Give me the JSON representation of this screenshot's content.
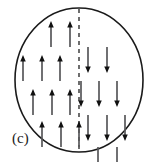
{
  "figure": {
    "panel_label": "(c)",
    "label_position": {
      "x": 12,
      "y": 131
    },
    "width": 156,
    "height": 162,
    "background_color": "#ffffff"
  },
  "boundary": {
    "shape": "circle",
    "center_x": 79,
    "center_y": 80,
    "radius_x": 64,
    "radius_y": 72,
    "stroke_color": "#1a1a1a",
    "stroke_width": 1.6,
    "fill": "none"
  },
  "divider": {
    "type": "dashed-vertical-line",
    "x": 79,
    "y_top": 9,
    "y_bottom": 152,
    "stroke_color": "#4a4a4a",
    "stroke_width": 1.6,
    "dash_pattern": "4 4"
  },
  "arrow_style": {
    "shaft_color": "#58585a",
    "head_color": "#111111",
    "shaft_width": 1.7,
    "head_width": 5.5,
    "head_length": 6.5,
    "length": 26
  },
  "chart_data": {
    "type": "scatter",
    "xlabel": "",
    "ylabel": "",
    "legend": [
      {
        "name": "up-spin domain",
        "direction": "up",
        "side": "left"
      },
      {
        "name": "down-spin domain",
        "direction": "down",
        "side": "right"
      }
    ],
    "rows": [
      {
        "row_index": 1,
        "y_tail": 47,
        "arrows": [
          {
            "x": 51,
            "direction": "up",
            "side": "left"
          },
          {
            "x": 70,
            "direction": "up",
            "side": "left"
          },
          {
            "x": 88,
            "direction": "down",
            "side": "right"
          },
          {
            "x": 107,
            "direction": "down",
            "side": "right"
          }
        ]
      },
      {
        "row_index": 2,
        "y_tail": 81,
        "arrows": [
          {
            "x": 23,
            "direction": "up",
            "side": "left"
          },
          {
            "x": 42,
            "direction": "up",
            "side": "left"
          },
          {
            "x": 60,
            "direction": "up",
            "side": "left"
          },
          {
            "x": 81,
            "direction": "down",
            "side": "right"
          },
          {
            "x": 99,
            "direction": "down",
            "side": "right"
          },
          {
            "x": 117,
            "direction": "down",
            "side": "right"
          }
        ]
      },
      {
        "row_index": 3,
        "y_tail": 115,
        "arrows": [
          {
            "x": 33,
            "direction": "up",
            "side": "left"
          },
          {
            "x": 52,
            "direction": "up",
            "side": "left"
          },
          {
            "x": 70,
            "direction": "up",
            "side": "left"
          },
          {
            "x": 88,
            "direction": "down",
            "side": "right"
          },
          {
            "x": 107,
            "direction": "down",
            "side": "right"
          },
          {
            "x": 125,
            "direction": "down",
            "side": "right"
          }
        ]
      },
      {
        "row_index": 4,
        "y_tail": 147,
        "arrows": [
          {
            "x": 42,
            "direction": "up",
            "side": "left"
          },
          {
            "x": 61,
            "direction": "up",
            "side": "left"
          },
          {
            "x": 79,
            "direction": "up",
            "side": "left"
          },
          {
            "x": 98,
            "direction": "down",
            "side": "right"
          },
          {
            "x": 117,
            "direction": "down",
            "side": "right"
          }
        ]
      }
    ],
    "arrow_count_total": 21,
    "arrow_count_up": 11,
    "arrow_count_down": 10
  }
}
